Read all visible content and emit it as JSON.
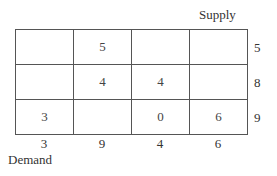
{
  "labels": {
    "supply": "Supply",
    "demand": "Demand"
  },
  "grid": {
    "rows": [
      [
        "",
        "5",
        "",
        ""
      ],
      [
        "",
        "4",
        "4",
        ""
      ],
      [
        "3",
        "",
        "0",
        "6"
      ]
    ]
  },
  "supply": [
    "5",
    "8",
    "9"
  ],
  "demand": [
    "3",
    "9",
    "4",
    "6"
  ]
}
